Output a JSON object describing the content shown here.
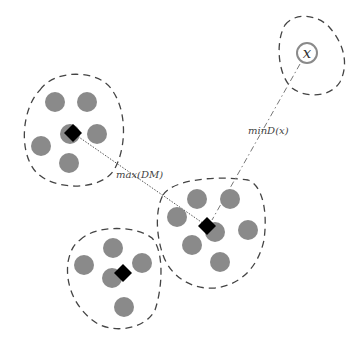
{
  "diagram": {
    "type": "clustering-illustration",
    "colors": {
      "point": "#8a8a8a",
      "medoid": "#000000",
      "boundary": "#444444",
      "query_ring": "#8a8a8a"
    },
    "labels": {
      "max_dm": "max(DM)",
      "min_d": "minD(x)",
      "query": "x"
    },
    "clusters": [
      {
        "name": "cluster-top-left",
        "medoid": [
          73,
          133
        ],
        "points": [
          [
            55,
            102
          ],
          [
            87,
            102
          ],
          [
            97,
            134
          ],
          [
            41,
            146
          ],
          [
            69,
            163
          ],
          [
            70,
            134
          ]
        ]
      },
      {
        "name": "cluster-middle-right",
        "medoid": [
          207,
          226
        ],
        "points": [
          [
            197,
            199
          ],
          [
            230,
            199
          ],
          [
            177,
            217
          ],
          [
            248,
            230
          ],
          [
            215,
            232
          ],
          [
            192,
            245
          ],
          [
            220,
            262
          ]
        ]
      },
      {
        "name": "cluster-bottom",
        "medoid": [
          123,
          273
        ],
        "points": [
          [
            113,
            248
          ],
          [
            84,
            265
          ],
          [
            142,
            263
          ],
          [
            112,
            278
          ],
          [
            124,
            307
          ]
        ]
      }
    ],
    "query_point": [
      307,
      53
    ]
  }
}
